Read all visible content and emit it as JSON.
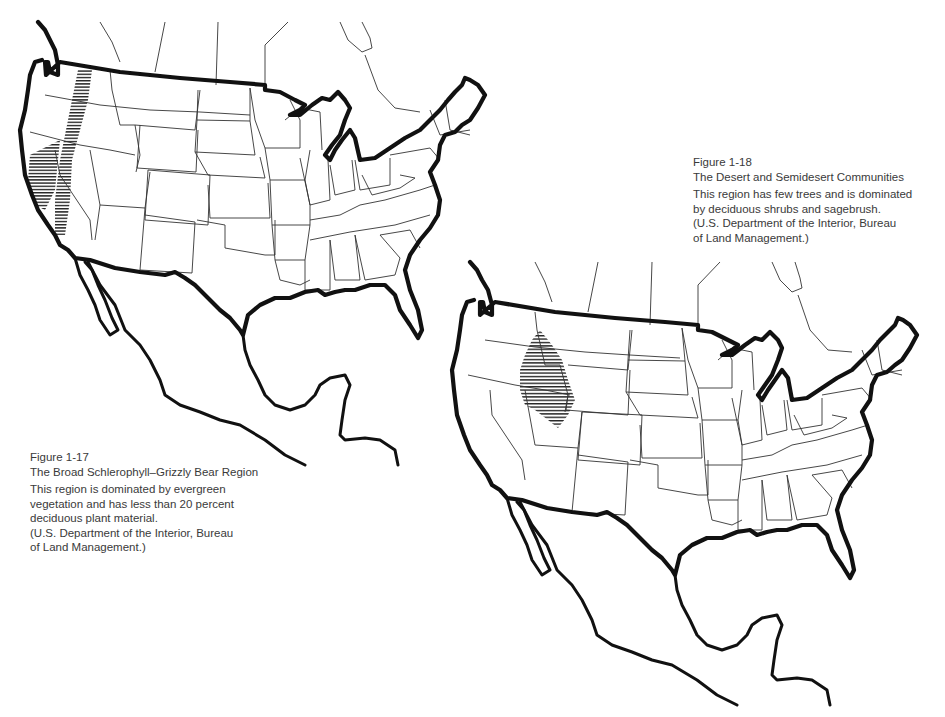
{
  "figures": [
    {
      "id": "fig-1-17",
      "number": "Figure 1-17",
      "title": "The Broad Schlerophyll–Grizzly Bear Region",
      "description_lines": [
        "This region is dominated by evergreen",
        "vegetation and has less than 20 percent",
        "deciduous plant material.",
        "(U.S. Department of the Interior, Bureau",
        "of Land Management.)"
      ],
      "map": {
        "subject": "United States with Mexico and southern Canada",
        "highlighted_region": "Pacific coast band (Washington, Oregon, California)",
        "highlight_pattern": "horizontal hatching"
      }
    },
    {
      "id": "fig-1-18",
      "number": "Figure 1-18",
      "title": "The Desert and Semidesert Communities",
      "description_lines": [
        "This region has few trees and is dominated",
        "by deciduous shrubs and sagebrush.",
        "(U.S. Department of the Interior, Bureau",
        "of Land Management.)"
      ],
      "map": {
        "subject": "United States with Mexico and southern Canada",
        "highlighted_region": "Great Basin area (Idaho / Wyoming / Utah)",
        "highlight_pattern": "horizontal hatching"
      }
    }
  ],
  "colors": {
    "background": "#ffffff",
    "ink": "#111111",
    "caption_text": "#3a3a3a"
  }
}
